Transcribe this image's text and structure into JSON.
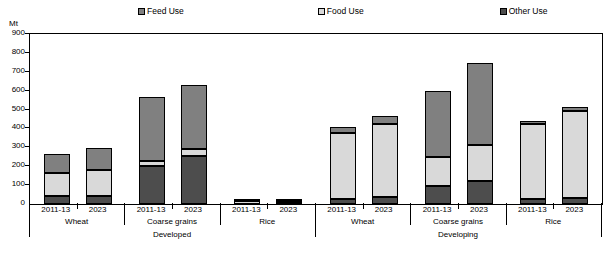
{
  "unit_label": "Mt",
  "legend": {
    "items": [
      {
        "label": "Feed Use",
        "color": "#808080",
        "icon": "feed-use-swatch"
      },
      {
        "label": "Food Use",
        "color": "#d9d9d9",
        "icon": "food-use-swatch"
      },
      {
        "label": "Other Use",
        "color": "#4d4d4d",
        "icon": "other-use-swatch"
      }
    ]
  },
  "colors": {
    "feed": "#808080",
    "food": "#d9d9d9",
    "other": "#4d4d4d",
    "axis": "#000000",
    "background": "#ffffff"
  },
  "axis": {
    "y_ticks": [
      "0",
      "100",
      "200",
      "300",
      "400",
      "500",
      "600",
      "700",
      "800",
      "900"
    ]
  },
  "groups": [
    {
      "label": "Wheat",
      "region": "Developed"
    },
    {
      "label": "Coarse grains",
      "region": "Developed"
    },
    {
      "label": "Rice",
      "region": "Developed"
    },
    {
      "label": "Wheat",
      "region": "Developing"
    },
    {
      "label": "Coarse grains",
      "region": "Developing"
    },
    {
      "label": "Rice",
      "region": "Developing"
    }
  ],
  "regions": [
    {
      "label": "Developed"
    },
    {
      "label": "Developing"
    }
  ],
  "period_labels": [
    "2011-13",
    "2023"
  ],
  "chart_data": {
    "type": "bar",
    "subtype": "stacked-bar",
    "title": "",
    "xlabel": "",
    "ylabel": "Mt",
    "ylim": [
      0,
      900
    ],
    "ytick_step": 100,
    "grid": false,
    "legend_position": "top",
    "categories": [
      "Developed / Wheat / 2011-13",
      "Developed / Wheat / 2023",
      "Developed / Coarse grains / 2011-13",
      "Developed / Coarse grains / 2023",
      "Developed / Rice / 2011-13",
      "Developed / Rice / 2023",
      "Developing / Wheat / 2011-13",
      "Developing / Wheat / 2023",
      "Developing / Coarse grains / 2011-13",
      "Developing / Coarse grains / 2023",
      "Developing / Rice / 2011-13",
      "Developing / Rice / 2023"
    ],
    "series": [
      {
        "name": "Other Use",
        "color": "#4d4d4d",
        "values": [
          40,
          45,
          200,
          255,
          2,
          3,
          25,
          35,
          95,
          120,
          25,
          30
        ]
      },
      {
        "name": "Food Use",
        "color": "#d9d9d9",
        "values": [
          125,
          135,
          30,
          35,
          13,
          15,
          350,
          390,
          155,
          190,
          400,
          465
        ]
      },
      {
        "name": "Feed Use",
        "color": "#808080",
        "values": [
          100,
          115,
          335,
          340,
          1,
          2,
          35,
          40,
          350,
          435,
          15,
          20
        ]
      }
    ],
    "totals": [
      265,
      295,
      565,
      630,
      16,
      20,
      410,
      465,
      600,
      745,
      440,
      515
    ],
    "stack_order": [
      "Other Use",
      "Food Use",
      "Feed Use"
    ]
  }
}
